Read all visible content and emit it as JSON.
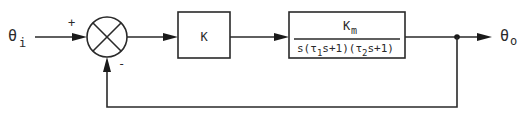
{
  "diagram": {
    "type": "feedback control block diagram",
    "input": {
      "symbol": "θ",
      "subscript": "i"
    },
    "output": {
      "symbol": "θ",
      "subscript": "o"
    },
    "summing_junction": {
      "plus_sign": "+",
      "minus_sign": "-"
    },
    "blocks": [
      {
        "id": "gain",
        "label": "K"
      },
      {
        "id": "plant",
        "numerator": {
          "symbol": "K",
          "subscript": "m"
        },
        "denominator": {
          "prefix": "s(τ",
          "tau1_subscript": "1",
          "mid": "s+1)(τ",
          "tau2_subscript": "2",
          "suffix": "s+1)"
        }
      }
    ],
    "feedback": "unity negative feedback"
  },
  "colors": {
    "line": "#2a2a2a",
    "background": "#ffffff"
  }
}
